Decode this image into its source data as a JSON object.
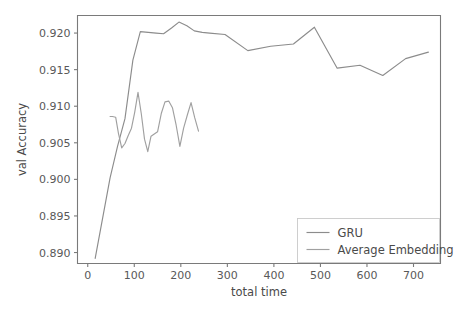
{
  "chart_data": {
    "type": "line",
    "title": "",
    "xlabel": "total time",
    "ylabel": "val Accuracy",
    "xlim": [
      -22,
      758
    ],
    "ylim": [
      0.8885,
      0.9224
    ],
    "xticks": [
      0,
      100,
      200,
      300,
      400,
      500,
      600,
      700
    ],
    "xticklabels": [
      "0",
      "100",
      "200",
      "300",
      "400",
      "500",
      "600",
      "700"
    ],
    "yticks": [
      0.89,
      0.895,
      0.9,
      0.905,
      0.91,
      0.915,
      0.92
    ],
    "yticklabels": [
      "0.890",
      "0.895",
      "0.900",
      "0.905",
      "0.910",
      "0.915",
      "0.920"
    ],
    "grid": false,
    "legend_position": "lower right",
    "series": [
      {
        "name": "GRU",
        "color": "#8c8c8c",
        "x": [
          16,
          48,
          64,
          80,
          97,
          113,
          130,
          147,
          163,
          180,
          196,
          213,
          229,
          246,
          262,
          295,
          344,
          393,
          442,
          487,
          536,
          585,
          634,
          683,
          732
        ],
        "y": [
          0.8892,
          0.9002,
          0.9045,
          0.9083,
          0.9163,
          0.9202,
          0.9201,
          0.92,
          0.9199,
          0.9207,
          0.9215,
          0.921,
          0.9203,
          0.9201,
          0.92,
          0.9198,
          0.9176,
          0.9182,
          0.9185,
          0.9208,
          0.9152,
          0.9156,
          0.9142,
          0.9165,
          0.9174
        ]
      },
      {
        "name": "Average Embedding",
        "color": "#a0a0a0",
        "x": [
          48,
          53,
          60,
          66,
          73,
          80,
          87,
          94,
          101,
          108,
          115,
          122,
          129,
          136,
          143,
          150,
          158,
          166,
          174,
          182,
          190,
          198,
          206,
          214,
          222,
          230,
          238
        ],
        "y": [
          0.9086,
          0.9086,
          0.9085,
          0.9063,
          0.9043,
          0.9049,
          0.906,
          0.907,
          0.9092,
          0.9119,
          0.909,
          0.9055,
          0.9038,
          0.9059,
          0.9062,
          0.9065,
          0.909,
          0.9106,
          0.9107,
          0.9098,
          0.9074,
          0.9045,
          0.907,
          0.9088,
          0.9105,
          0.9084,
          0.9066
        ]
      }
    ]
  },
  "legend": {
    "items": [
      {
        "label": "GRU"
      },
      {
        "label": "Average Embedding"
      }
    ]
  },
  "axes": {
    "x_title": "total time",
    "y_title": "val Accuracy"
  },
  "colors": {
    "background": "#ffffff",
    "axis": "#7a7a7a",
    "text": "#4a4a4a",
    "series_gru": "#8c8c8c",
    "series_avg": "#a0a0a0"
  }
}
